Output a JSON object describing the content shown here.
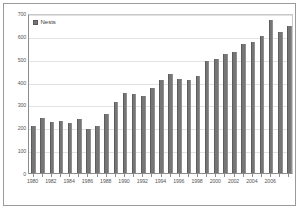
{
  "chart_data": {
    "type": "bar",
    "title": "",
    "xlabel": "",
    "ylabel": "",
    "ylim": [
      0,
      700
    ],
    "ytick_values": [
      0,
      100,
      200,
      300,
      400,
      500,
      600,
      700
    ],
    "ytick_labels": [
      "0",
      "100",
      "200",
      "300",
      "400",
      "500",
      "600",
      "700"
    ],
    "grid": true,
    "legend_position": "top-left",
    "legend": [
      "Nests"
    ],
    "series_name": "Nests",
    "bar_color": "#767676",
    "categories": [
      "1980",
      "1981",
      "1982",
      "1983",
      "1984",
      "1985",
      "1986",
      "1987",
      "1988",
      "1989",
      "1990",
      "1991",
      "1992",
      "1993",
      "1994",
      "1995",
      "1996",
      "1997",
      "1998",
      "1999",
      "2000",
      "2001",
      "2002",
      "2003",
      "2004",
      "2005",
      "2006",
      "2007",
      "2008"
    ],
    "values": [
      205,
      240,
      222,
      228,
      218,
      235,
      193,
      207,
      258,
      312,
      350,
      345,
      335,
      372,
      405,
      435,
      410,
      405,
      425,
      490,
      500,
      520,
      530,
      565,
      572,
      600,
      670,
      615,
      645
    ],
    "xtick_labels": [
      "1980",
      "1982",
      "1984",
      "1986",
      "1988",
      "1990",
      "1992",
      "1994",
      "1996",
      "1998",
      "2000",
      "2002",
      "2004",
      "2006"
    ],
    "xtick_indices": [
      0,
      2,
      4,
      6,
      8,
      10,
      12,
      14,
      16,
      18,
      20,
      22,
      24,
      26
    ]
  }
}
